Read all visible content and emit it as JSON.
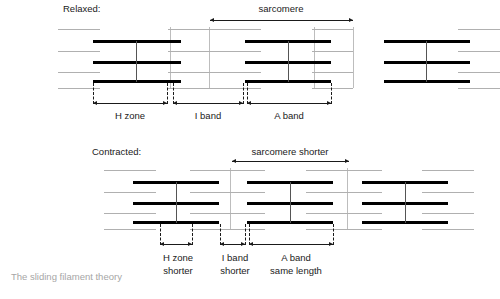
{
  "figure": {
    "caption": "The sliding filament theory",
    "panels": [
      {
        "id": "relaxed",
        "state_label": "Relaxed:",
        "sarcomere_label": "sarcomere",
        "measures": [
          {
            "name": "h-zone",
            "line1": "H zone",
            "line2": ""
          },
          {
            "name": "i-band",
            "line1": "I band",
            "line2": ""
          },
          {
            "name": "a-band",
            "line1": "A band",
            "line2": ""
          }
        ]
      },
      {
        "id": "contracted",
        "state_label": "Contracted:",
        "sarcomere_label": "sarcomere shorter",
        "measures": [
          {
            "name": "h-zone",
            "line1": "H zone",
            "line2": "shorter"
          },
          {
            "name": "i-band",
            "line1": "I band",
            "line2": "shorter"
          },
          {
            "name": "a-band",
            "line1": "A band",
            "line2": "same length"
          }
        ]
      }
    ],
    "colors": {
      "thick_filament": "#000000",
      "thin_filament": "#b0b0b0",
      "z_line": "#bdbdbd",
      "m_line": "#555555",
      "caption": "#a6a6a6",
      "text": "#1a1a1a"
    }
  }
}
